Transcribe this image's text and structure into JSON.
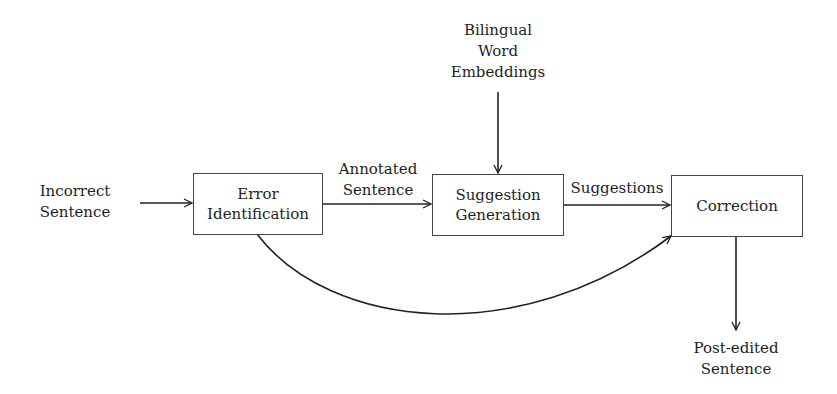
{
  "diagram": {
    "type": "flowchart",
    "inputs": {
      "incorrect_sentence": [
        "Incorrect",
        "Sentence"
      ],
      "bilingual_embeddings": [
        "Bilingual",
        "Word",
        "Embeddings"
      ]
    },
    "nodes": {
      "error_identification": [
        "Error",
        "Identification"
      ],
      "suggestion_generation": [
        "Suggestion",
        "Generation"
      ],
      "correction": [
        "Correction"
      ]
    },
    "edge_labels": {
      "annotated_sentence": [
        "Annotated",
        "Sentence"
      ],
      "suggestions": [
        "Suggestions"
      ]
    },
    "outputs": {
      "post_edited_sentence": [
        "Post-edited",
        "Sentence"
      ]
    },
    "edges": [
      {
        "from": "Incorrect Sentence",
        "to": "Error Identification"
      },
      {
        "from": "Error Identification",
        "to": "Suggestion Generation",
        "label": "Annotated Sentence"
      },
      {
        "from": "Bilingual Word Embeddings",
        "to": "Suggestion Generation"
      },
      {
        "from": "Suggestion Generation",
        "to": "Correction",
        "label": "Suggestions"
      },
      {
        "from": "Error Identification",
        "to": "Correction",
        "style": "curved"
      },
      {
        "from": "Correction",
        "to": "Post-edited Sentence"
      }
    ]
  }
}
